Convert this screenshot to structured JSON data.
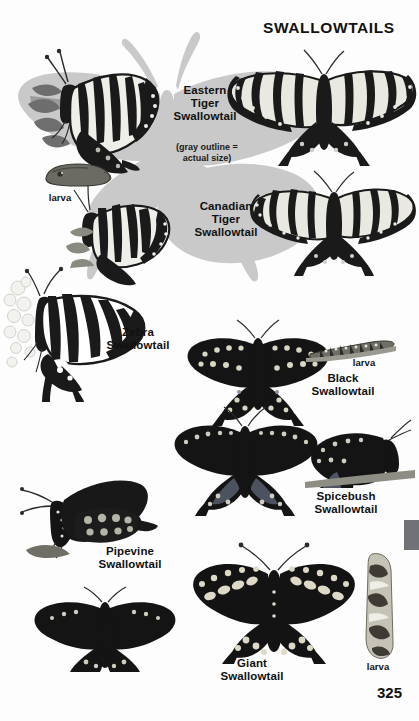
{
  "page": {
    "title": "SWALLOWTAILS",
    "number": "325",
    "background_color": "#fdfdfd",
    "ink_color": "#111111",
    "silhouette_color": "#c9c9c9",
    "edge_tab_color": "#6f7276"
  },
  "note": {
    "line1": "(gray outline =",
    "line2": "actual size)"
  },
  "species": [
    {
      "id": "eastern-tiger",
      "name_lines": [
        "Eastern",
        "Tiger",
        "Swallowtail"
      ],
      "full_name": "Eastern Tiger Swallowtail"
    },
    {
      "id": "canadian-tiger",
      "name_lines": [
        "Canadian",
        "Tiger",
        "Swallowtail"
      ],
      "full_name": "Canadian Tiger Swallowtail"
    },
    {
      "id": "zebra",
      "name_lines": [
        "Zebra",
        "Swallowtail"
      ],
      "full_name": "Zebra Swallowtail"
    },
    {
      "id": "black",
      "name_lines": [
        "Black",
        "Swallowtail"
      ],
      "full_name": "Black Swallowtail"
    },
    {
      "id": "spicebush",
      "name_lines": [
        "Spicebush",
        "Swallowtail"
      ],
      "full_name": "Spicebush Swallowtail"
    },
    {
      "id": "pipevine",
      "name_lines": [
        "Pipevine",
        "Swallowtail"
      ],
      "full_name": "Pipevine Swallowtail"
    },
    {
      "id": "giant",
      "name_lines": [
        "Giant",
        "Swallowtail"
      ],
      "full_name": "Giant Swallowtail"
    }
  ],
  "larva_labels": [
    {
      "id": "tiger-larva",
      "label": "larva"
    },
    {
      "id": "black-larva",
      "label": "larva"
    },
    {
      "id": "giant-larva",
      "label": "larva"
    }
  ]
}
